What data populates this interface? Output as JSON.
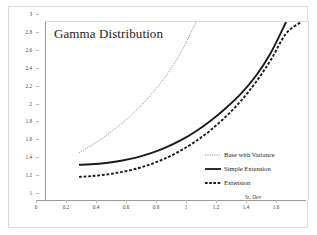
{
  "chart_data": {
    "type": "line",
    "title": "Gamma Distribution",
    "xlabel": "St. Dev",
    "ylabel": "",
    "xlim": [
      0,
      1.76
    ],
    "ylim": [
      1,
      3
    ],
    "grid": false,
    "legend_position": "inside-right",
    "x_ticks": [
      "0",
      "0.2",
      "0.4",
      "0.6",
      "0.8",
      "1",
      "1.2",
      "1.4",
      "1.6"
    ],
    "x_tick_values": [
      0,
      0.2,
      0.4,
      0.6,
      0.8,
      1,
      1.2,
      1.4,
      1.6
    ],
    "y_ticks": [
      "3",
      "2.8",
      "2.6",
      "2.4",
      "2.2",
      "2",
      "1.8",
      "1.6",
      "1.4",
      "1.2",
      "1"
    ],
    "y_tick_values": [
      3,
      2.8,
      2.6,
      2.4,
      2.2,
      2,
      1.8,
      1.6,
      1.4,
      1.2,
      1
    ],
    "x": [
      0.22,
      0.3,
      0.4,
      0.5,
      0.6,
      0.7,
      0.8,
      0.9,
      1.0,
      1.1,
      1.2,
      1.3,
      1.4,
      1.5,
      1.6,
      1.7,
      1.76
    ],
    "series": [
      {
        "name": "Base with Variance",
        "style": "dotted",
        "color": "#8a8a8a",
        "width": 0.9,
        "values": [
          1.54,
          1.62,
          1.73,
          1.86,
          2.01,
          2.19,
          2.4,
          2.66,
          3.0,
          null,
          null,
          null,
          null,
          null,
          null,
          null,
          null
        ]
      },
      {
        "name": "Simple Extension",
        "style": "solid",
        "color": "#1a1a1a",
        "width": 1.9,
        "values": [
          1.405,
          1.41,
          1.425,
          1.45,
          1.485,
          1.535,
          1.6,
          1.68,
          1.78,
          1.9,
          2.04,
          2.2,
          2.4,
          2.66,
          3.0,
          null,
          null
        ]
      },
      {
        "name": "Extension",
        "style": "dashed",
        "color": "#1a1a1a",
        "width": 1.9,
        "values": [
          1.27,
          1.278,
          1.295,
          1.322,
          1.36,
          1.412,
          1.48,
          1.565,
          1.67,
          1.795,
          1.945,
          2.12,
          2.33,
          2.58,
          2.87,
          3.0,
          null
        ]
      }
    ]
  },
  "legend": {
    "items": [
      {
        "label": "Base with Variance",
        "swatch": "dotted-line-swatch"
      },
      {
        "label": "Simple Extension",
        "swatch": "solid-line-swatch"
      },
      {
        "label": "Extension",
        "swatch": "dashed-line-swatch"
      }
    ]
  },
  "colors": {
    "base_with_variance": "#8a8a8a",
    "simple_extension": "#1a1a1a",
    "extension": "#1a1a1a",
    "axis": "#9a9a9a",
    "background": "#ffffff"
  }
}
